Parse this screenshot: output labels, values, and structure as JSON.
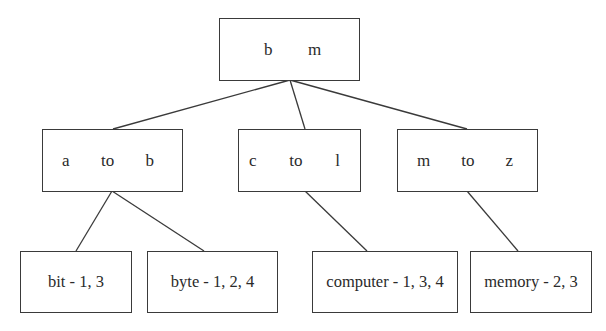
{
  "diagram": {
    "type": "b-tree-index",
    "root": {
      "keys": [
        "b",
        "m"
      ]
    },
    "internal": [
      {
        "from": "a",
        "sep": "to",
        "to": "b"
      },
      {
        "from": "c",
        "sep": "to",
        "to": "l"
      },
      {
        "from": "m",
        "sep": "to",
        "to": "z"
      }
    ],
    "leaves": [
      {
        "label": "bit - 1, 3",
        "parent": "a to b"
      },
      {
        "label": "byte - 1, 2, 4",
        "parent": "a to b"
      },
      {
        "label": "computer - 1, 3, 4",
        "parent": "c to l"
      },
      {
        "label": "memory - 2, 3",
        "parent": "m to z"
      }
    ]
  },
  "colors": {
    "stroke": "#3a3a3a",
    "text": "#2a2a2a",
    "background": "#ffffff"
  }
}
